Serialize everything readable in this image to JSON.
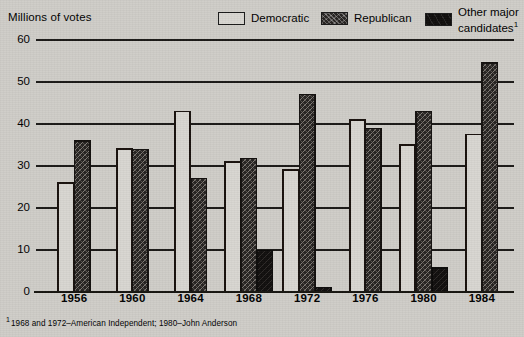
{
  "header": {
    "axis_title": "Millions of votes"
  },
  "legend": {
    "items": [
      {
        "label": "Democratic",
        "swatch": "dem-swatch-icon",
        "color": "#d8d6d1"
      },
      {
        "label": "Republican",
        "swatch": "rep-swatch-icon",
        "color": "#262321"
      },
      {
        "label": "Other major candidates",
        "swatch": "other-swatch-icon",
        "color": "#0f0d0c",
        "footnote_marker": "1"
      }
    ]
  },
  "footnote": {
    "marker": "1",
    "text": "1968 and 1972–American Independent; 1980–John Anderson"
  },
  "chart_data": {
    "type": "bar",
    "title": "",
    "xlabel": "",
    "ylabel": "Millions of votes",
    "ylim": [
      0,
      60
    ],
    "yticks": [
      0,
      10,
      20,
      30,
      40,
      50,
      60
    ],
    "ytick_labels": [
      "0",
      "10",
      "20",
      "30",
      "40",
      "50",
      "60"
    ],
    "grid": true,
    "legend_position": "top-right",
    "categories": [
      "1956",
      "1960",
      "1964",
      "1968",
      "1972",
      "1976",
      "1980",
      "1984"
    ],
    "series": [
      {
        "name": "Democratic",
        "color": "#d8d6d1",
        "values": [
          26,
          34,
          43,
          31,
          29,
          41,
          35,
          37.5
        ]
      },
      {
        "name": "Republican",
        "color": "#262321",
        "values": [
          36,
          34,
          27,
          31.8,
          47,
          39,
          43,
          54.5
        ]
      },
      {
        "name": "Other major candidates",
        "color": "#0f0d0c",
        "values": [
          null,
          null,
          null,
          9.9,
          1.1,
          null,
          5.7,
          null
        ]
      }
    ]
  }
}
